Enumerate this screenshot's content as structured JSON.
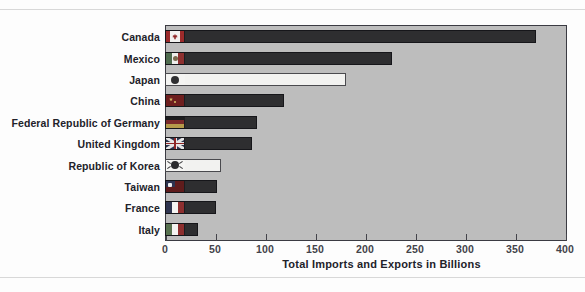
{
  "chart_data": {
    "type": "bar",
    "orientation": "horizontal",
    "title": "",
    "xlabel": "Total Imports and Exports in Billions",
    "ylabel": "",
    "xlim": [
      0,
      400
    ],
    "xticks": [
      0,
      50,
      100,
      150,
      200,
      250,
      300,
      350,
      400
    ],
    "xticklabels": [
      "0",
      "50",
      "100",
      "150",
      "200",
      "250",
      "300",
      "350",
      "400"
    ],
    "grid": false,
    "legend": false,
    "categories": [
      "Canada",
      "Mexico",
      "Japan",
      "China",
      "Federal Republic of Germany",
      "United Kingdom",
      "Republic of Korea",
      "Taiwan",
      "France",
      "Italy"
    ],
    "values": [
      371,
      227,
      181,
      119,
      92,
      87,
      56,
      52,
      51,
      33
    ],
    "bars": [
      {
        "label": "Canada",
        "value": 371,
        "flag": "canada-flag-icon",
        "style": "dark"
      },
      {
        "label": "Mexico",
        "value": 227,
        "flag": "mexico-flag-icon",
        "style": "dark"
      },
      {
        "label": "Japan",
        "value": 181,
        "flag": "japan-flag-icon",
        "style": "light"
      },
      {
        "label": "China",
        "value": 119,
        "flag": "china-flag-icon",
        "style": "dark"
      },
      {
        "label": "Federal Republic of Germany",
        "value": 92,
        "flag": "germany-flag-icon",
        "style": "dark"
      },
      {
        "label": "United Kingdom",
        "value": 87,
        "flag": "united-kingdom-flag-icon",
        "style": "dark"
      },
      {
        "label": "Republic of Korea",
        "value": 56,
        "flag": "south-korea-flag-icon",
        "style": "light"
      },
      {
        "label": "Taiwan",
        "value": 52,
        "flag": "taiwan-flag-icon",
        "style": "dark"
      },
      {
        "label": "France",
        "value": 51,
        "flag": "france-flag-icon",
        "style": "dark"
      },
      {
        "label": "Italy",
        "value": 33,
        "flag": "italy-flag-icon",
        "style": "dark"
      }
    ],
    "colors": {
      "plot_background": "#bdbdbd",
      "plot_border": "#3b3b42",
      "bar_dark": "#2e2e30",
      "bar_light": "#f2f2f0",
      "text": "#22222a",
      "page_background": "#fdfdfd"
    }
  }
}
